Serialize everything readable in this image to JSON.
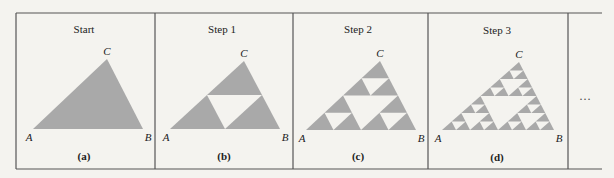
{
  "figure": {
    "background": "#f4f3ef",
    "line_color": "#555555",
    "fill_color": "#a9a9a9",
    "hole_color": "#f4f3ef",
    "frame": {
      "left": 16,
      "top": 13,
      "bottom": 169,
      "right_extent": 602
    },
    "dividers": [
      155,
      293,
      428,
      568
    ],
    "continuation": {
      "label": "…",
      "x": 585,
      "y": 100
    },
    "panels": [
      {
        "title": "Start",
        "caption": "(a)",
        "depth": 0,
        "title_pos": [
          84,
          33
        ],
        "caption_pos": [
          84,
          160
        ],
        "vertices": {
          "A": [
            33,
            129
          ],
          "B": [
            143,
            129
          ],
          "C": [
            107,
            59
          ]
        },
        "labels": {
          "A": "A",
          "B": "B",
          "C": "C"
        }
      },
      {
        "title": "Step 1",
        "caption": "(b)",
        "depth": 1,
        "title_pos": [
          222,
          33
        ],
        "caption_pos": [
          224,
          160
        ],
        "vertices": {
          "A": [
            170,
            129
          ],
          "B": [
            280,
            129
          ],
          "C": [
            244,
            61
          ]
        },
        "labels": {
          "A": "A",
          "B": "B",
          "C": "C"
        }
      },
      {
        "title": "Step 2",
        "caption": "(c)",
        "depth": 2,
        "title_pos": [
          358,
          33
        ],
        "caption_pos": [
          358,
          160
        ],
        "vertices": {
          "A": [
            306,
            130
          ],
          "B": [
            416,
            130
          ],
          "C": [
            380,
            61
          ]
        },
        "labels": {
          "A": "A",
          "B": "B",
          "C": "C"
        }
      },
      {
        "title": "Step 3",
        "caption": "(d)",
        "depth": 3,
        "title_pos": [
          497,
          34
        ],
        "caption_pos": [
          497,
          161
        ],
        "vertices": {
          "A": [
            442,
            130
          ],
          "B": [
            554,
            130
          ],
          "C": [
            519,
            62
          ]
        },
        "labels": {
          "A": "A",
          "B": "B",
          "C": "C"
        }
      }
    ]
  }
}
